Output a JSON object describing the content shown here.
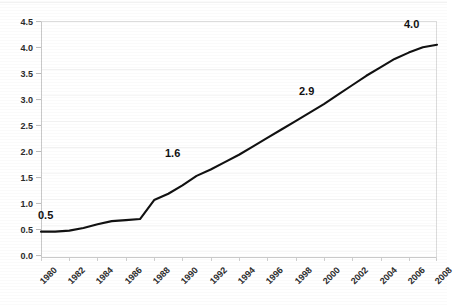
{
  "chart_data": {
    "type": "line",
    "title": "",
    "subtitle": "",
    "xlabel": "",
    "ylabel": "",
    "grid": true,
    "legend": "none",
    "ylim": [
      0.0,
      4.5
    ],
    "ytick_labels": [
      "4.5",
      "4.0",
      "3.5",
      "3.0",
      "2.5",
      "2.0",
      "1.5",
      "1.0",
      "0.5",
      "0.0"
    ],
    "ytick_values": [
      4.5,
      4.0,
      3.5,
      3.0,
      2.5,
      2.0,
      1.5,
      1.0,
      0.5,
      0.0
    ],
    "xlim": [
      1980,
      2008
    ],
    "xtick_labels": [
      "1980",
      "1982",
      "1984",
      "1986",
      "1988",
      "1990",
      "1992",
      "1994",
      "1996",
      "1998",
      "2000",
      "2002",
      "2004",
      "2006",
      "2008"
    ],
    "xtick_values": [
      1980,
      1982,
      1984,
      1986,
      1988,
      1990,
      1992,
      1994,
      1996,
      1998,
      2000,
      2002,
      2004,
      2006,
      2008
    ],
    "x": [
      1980,
      1981,
      1982,
      1983,
      1984,
      1985,
      1986,
      1987,
      1988,
      1989,
      1990,
      1991,
      1992,
      1993,
      1994,
      1995,
      1996,
      1997,
      1998,
      1999,
      2000,
      2001,
      2002,
      2003,
      2004,
      2005,
      2006,
      2007,
      2008
    ],
    "series": [
      {
        "name": "value",
        "color": "#111111",
        "values": [
          0.5,
          0.5,
          0.52,
          0.57,
          0.64,
          0.7,
          0.72,
          0.74,
          1.1,
          1.22,
          1.38,
          1.56,
          1.68,
          1.82,
          1.96,
          2.12,
          2.28,
          2.44,
          2.6,
          2.76,
          2.92,
          3.1,
          3.28,
          3.46,
          3.62,
          3.78,
          3.9,
          4.0,
          4.05
        ]
      }
    ],
    "annotations": [
      {
        "label": "0.5",
        "x": 1980,
        "y": 0.5
      },
      {
        "label": "1.6",
        "x": 1991,
        "y": 1.56
      },
      {
        "label": "2.9",
        "x": 2000,
        "y": 2.92
      },
      {
        "label": "4.0",
        "x": 2008,
        "y": 4.05
      }
    ],
    "colors": {
      "line": "#111111",
      "axis": "#c9c9c9",
      "grid": "#f4f4f4",
      "text": "#2b2b2b",
      "background": "#ffffff"
    }
  }
}
